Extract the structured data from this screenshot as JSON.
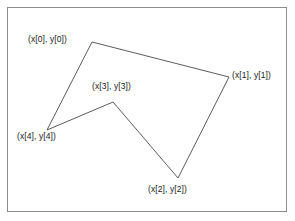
{
  "figure": {
    "background_color": "#ffffff",
    "frame": {
      "name": "figure-border",
      "color": "#8d8d8d",
      "x": 7,
      "y": 7,
      "width": 280,
      "height": 205
    },
    "stroke_color": "#4a4a4a",
    "stroke_width": 0.9
  },
  "chart_data": {
    "type": "line",
    "xlabel": "",
    "ylabel": "",
    "closed_path": true,
    "point_order": [
      0,
      1,
      2,
      3,
      4
    ],
    "points": [
      {
        "index": 0,
        "label": "(x[0], y[0])",
        "x": 92,
        "y": 42
      },
      {
        "index": 1,
        "label": "(x[1], y[1])",
        "x": 229,
        "y": 77
      },
      {
        "index": 2,
        "label": "(x[2], y[2])",
        "x": 178,
        "y": 178
      },
      {
        "index": 3,
        "label": "(x[3], y[3])",
        "x": 113,
        "y": 102
      },
      {
        "index": 4,
        "label": "(x[4], y[4])",
        "x": 47,
        "y": 130
      }
    ],
    "edges": [
      {
        "from": 0,
        "to": 1
      },
      {
        "from": 1,
        "to": 2
      },
      {
        "from": 2,
        "to": 3
      },
      {
        "from": 3,
        "to": 4
      },
      {
        "from": 4,
        "to": 0
      }
    ],
    "labels": [
      {
        "name": "label-vertex-0",
        "text": "(x[0], y[0])",
        "x": 28,
        "y": 34
      },
      {
        "name": "label-vertex-1",
        "text": "(x[1], y[1])",
        "x": 232,
        "y": 70
      },
      {
        "name": "label-vertex-2",
        "text": "(x[2], y[2])",
        "x": 148,
        "y": 184
      },
      {
        "name": "label-vertex-3",
        "text": "(x[3], y[3])",
        "x": 92,
        "y": 81
      },
      {
        "name": "label-vertex-4",
        "text": "(x[4], y[4])",
        "x": 17,
        "y": 131
      }
    ]
  }
}
